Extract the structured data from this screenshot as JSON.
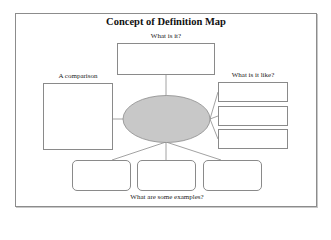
{
  "diagram": {
    "title": "Concept of Definition Map",
    "labels": {
      "top": "What is it?",
      "left": "A comparison",
      "right": "What is it like?",
      "bottom": "What are some examples?"
    },
    "center_node": {
      "shape": "ellipse",
      "fill": "#c8c8c8",
      "stroke": "#8a8a8a",
      "text": ""
    },
    "nodes": {
      "what_is_it": {
        "count": 1,
        "shape": "rectangle"
      },
      "comparison": {
        "count": 1,
        "shape": "rectangle"
      },
      "what_is_it_like": {
        "count": 3,
        "shape": "rectangle"
      },
      "examples": {
        "count": 3,
        "shape": "rounded-rectangle"
      }
    },
    "colors": {
      "line": "#8a8a8a",
      "frame": "#8c8c8c",
      "background": "#ffffff"
    }
  }
}
